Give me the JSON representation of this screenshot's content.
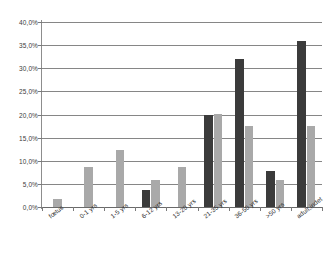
{
  "chart_data": {
    "type": "bar",
    "title": "",
    "subtitle": "",
    "xlabel": "",
    "ylabel": "",
    "ylim": [
      0,
      40
    ],
    "ytick_labels": [
      "40,0%",
      "35,0%",
      "30,0%",
      "25,0%",
      "20,0%",
      "15,0%",
      "10,0%",
      "5,0%",
      "0,0%"
    ],
    "ytick_values": [
      40,
      35,
      30,
      25,
      20,
      15,
      10,
      5,
      0
    ],
    "grid": true,
    "legend": "none",
    "categories": [
      "fœtus",
      "0-1 yrs",
      "1-5 yrs",
      "6-12 yrs",
      "13-20 yrs",
      "21-35 yrs",
      "36-50 yrs",
      ">50 yrs",
      "adult,indet"
    ],
    "series": [
      {
        "name": "series-dark",
        "color": "#3b3b3b",
        "values": [
          0,
          0,
          0,
          3.6,
          0,
          19.9,
          32.0,
          7.8,
          35.8
        ]
      },
      {
        "name": "series-light",
        "color": "#a9a9a9",
        "values": [
          1.8,
          8.7,
          12.3,
          5.9,
          8.7,
          20.1,
          17.6,
          5.9,
          17.6
        ]
      }
    ]
  }
}
